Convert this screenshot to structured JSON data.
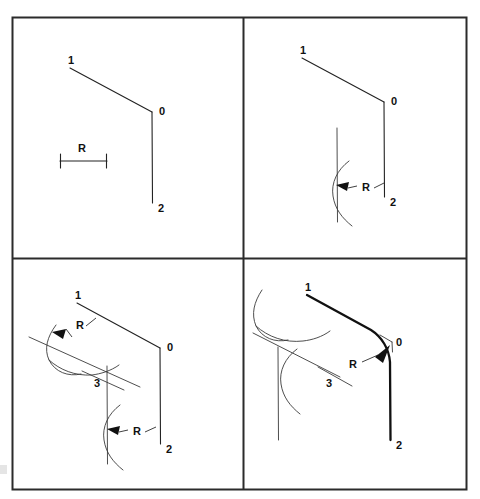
{
  "figure": {
    "background_color": "#ffffff",
    "ink_color": "#222222",
    "frame_color": "#2b2b2b",
    "panel_count": 4
  },
  "panels": [
    {
      "id": "panel-1",
      "position": "top-left",
      "step": 1,
      "caption": "Given two lines meeting at vertex 0 and the radius R",
      "labels": {
        "point_1": "1",
        "point_0": "0",
        "point_2": "2",
        "radius": "R"
      },
      "geometry": {
        "point_1": [
          70,
          68
        ],
        "point_0": [
          152,
          112
        ],
        "point_2": [
          152,
          203
        ],
        "scale_bar_start": [
          60,
          161
        ],
        "scale_bar_end": [
          107,
          161
        ]
      }
    },
    {
      "id": "panel-2",
      "position": "top-right",
      "step": 2,
      "caption": "Draw a line parallel to 0-2 at distance R, and an arc of radius R",
      "labels": {
        "point_1": "1",
        "point_0": "0",
        "point_2": "2",
        "radius": "R"
      },
      "geometry": {
        "point_1": [
          302,
          58
        ],
        "point_0": [
          384,
          102
        ],
        "point_2": [
          384,
          197
        ],
        "parallel_line_start": [
          337,
          128
        ],
        "parallel_line_end": [
          337,
          222
        ],
        "offset_distance": "R"
      }
    },
    {
      "id": "panel-3",
      "position": "bottom-left",
      "step": 3,
      "caption": "Draw a second parallel line at distance R from 1-0; the lines cross at center 3",
      "labels": {
        "point_1": "1",
        "point_0": "0",
        "point_2": "2",
        "point_3": "3",
        "radius_upper": "R",
        "radius_lower": "R"
      },
      "geometry": {
        "point_1": [
          77,
          303
        ],
        "point_0": [
          160,
          348
        ],
        "point_2": [
          160,
          444
        ],
        "point_3": [
          106,
          380
        ],
        "parallel_line_1_start": [
          29,
          337
        ],
        "parallel_line_1_end": [
          140,
          387
        ],
        "parallel_line_2_start": [
          107,
          366
        ],
        "parallel_line_2_end": [
          107,
          464
        ]
      }
    },
    {
      "id": "panel-4",
      "position": "bottom-right",
      "step": 4,
      "caption": "Swing radius R about center 3 to draw the fillet joining the two lines",
      "labels": {
        "point_1": "1",
        "point_0": "0",
        "point_2": "2",
        "point_3": "3",
        "radius": "R"
      },
      "geometry": {
        "point_1": [
          307,
          295
        ],
        "point_0": [
          390,
          341
        ],
        "point_2": [
          390,
          440
        ],
        "point_3": [
          337,
          378
        ],
        "fillet_radius_label": "R"
      }
    }
  ],
  "annotations": {
    "radius_symbol": "R",
    "vertex_label": "0",
    "endpoint_a_label": "1",
    "endpoint_b_label": "2",
    "center_label": "3"
  }
}
